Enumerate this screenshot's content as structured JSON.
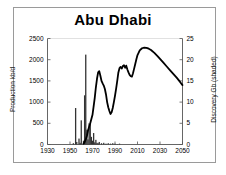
{
  "chart_data": {
    "type": "line",
    "title": "Abu Dhabi",
    "xlabel": "",
    "ylabel": "Production kb/d",
    "y2label": "Discovery Gb (shaded)",
    "xlim": [
      1930,
      2050
    ],
    "ylim": [
      0,
      2500
    ],
    "y2lim": [
      0,
      25
    ],
    "grid": false,
    "legend": "none",
    "xticks": [
      "1930",
      "1950",
      "1970",
      "1990",
      "2010",
      "2030",
      "2050"
    ],
    "xtick_values": [
      1930,
      1950,
      1970,
      1990,
      2010,
      2030,
      2050
    ],
    "yticks_left": [
      "0",
      "500",
      "1000",
      "1500",
      "2000",
      "2500"
    ],
    "ytick_left_values": [
      0,
      500,
      1000,
      1500,
      2000,
      2500
    ],
    "yticks_right": [
      "0",
      "5",
      "10",
      "15",
      "20",
      "25"
    ],
    "ytick_right_values": [
      0,
      5,
      10,
      15,
      20,
      25
    ],
    "series": [
      {
        "name": "Production kb/d",
        "axis": "left",
        "type": "line",
        "color": "#000000",
        "x": [
          1962,
          1963,
          1964,
          1965,
          1966,
          1967,
          1968,
          1969,
          1970,
          1971,
          1972,
          1973,
          1974,
          1975,
          1976,
          1977,
          1978,
          1979,
          1980,
          1981,
          1982,
          1983,
          1984,
          1985,
          1986,
          1987,
          1988,
          1989,
          1990,
          1991,
          1992,
          1993,
          1994,
          1995,
          1996,
          1997,
          1998,
          1999,
          2000,
          2001,
          2002,
          2003,
          2004,
          2005,
          2006,
          2007,
          2008,
          2009,
          2010,
          2012,
          2014,
          2016,
          2018,
          2020,
          2022,
          2025,
          2028,
          2030,
          2033,
          2036,
          2039,
          2042,
          2045,
          2048,
          2050
        ],
        "y": [
          20,
          60,
          120,
          200,
          330,
          420,
          500,
          600,
          700,
          900,
          1100,
          1350,
          1550,
          1700,
          1730,
          1620,
          1500,
          1440,
          1390,
          1310,
          1180,
          1000,
          880,
          790,
          720,
          760,
          860,
          1000,
          1150,
          1320,
          1500,
          1700,
          1800,
          1830,
          1790,
          1850,
          1870,
          1810,
          1860,
          1770,
          1700,
          1640,
          1610,
          1600,
          1680,
          1790,
          1900,
          2010,
          2110,
          2220,
          2270,
          2285,
          2280,
          2260,
          2230,
          2160,
          2080,
          2020,
          1930,
          1840,
          1750,
          1660,
          1570,
          1470,
          1400
        ]
      },
      {
        "name": "Discovery Gb (shaded)",
        "axis": "right",
        "type": "bar",
        "color": "#333333",
        "x": [
          1953,
          1955,
          1956,
          1958,
          1959,
          1960,
          1962,
          1963,
          1964,
          1965,
          1966,
          1967,
          1968,
          1969,
          1970,
          1971,
          1972,
          1973,
          1974,
          1975,
          1976,
          1978,
          1980,
          1982,
          1984,
          1986,
          1988,
          1990,
          1992,
          1994
        ],
        "y": [
          0.3,
          8.6,
          0.6,
          1.4,
          0.4,
          5.7,
          0.9,
          11.6,
          21.2,
          3.5,
          1.2,
          5.0,
          4.9,
          1.8,
          0.9,
          2.7,
          0.5,
          1.1,
          0.4,
          0.3,
          0.6,
          0.3,
          0.4,
          0.2,
          0.3,
          0.2,
          0.3,
          0.2,
          0.1,
          0.2
        ]
      }
    ]
  }
}
